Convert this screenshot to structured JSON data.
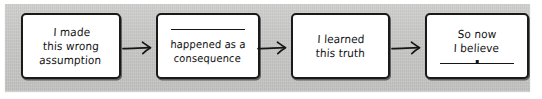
{
  "diagram": {
    "style": "hand-drawn flowchart on grey card",
    "background_color": "#c9c9c7",
    "box_fill_color": "#ffffff",
    "ink_color": "#1a1a1a",
    "nodes": [
      {
        "id": "node-1",
        "text": "I made\nthis wrong\nassumption",
        "blank_top": false,
        "blank_bottom": false
      },
      {
        "id": "node-2",
        "text": "happened as a\nconsequence",
        "blank_top": true,
        "blank_bottom": false
      },
      {
        "id": "node-3",
        "text": "I learned\nthis truth",
        "blank_top": false,
        "blank_bottom": false
      },
      {
        "id": "node-4",
        "text": "So now\nI believe",
        "blank_top": false,
        "blank_bottom": true
      }
    ],
    "connectors": [
      {
        "id": "arrow-1",
        "from": "node-1",
        "to": "node-2",
        "glyph": "arrow-right-icon"
      },
      {
        "id": "arrow-2",
        "from": "node-2",
        "to": "node-3",
        "glyph": "arrow-right-icon"
      },
      {
        "id": "arrow-3",
        "from": "node-3",
        "to": "node-4",
        "glyph": "arrow-right-icon"
      }
    ]
  }
}
